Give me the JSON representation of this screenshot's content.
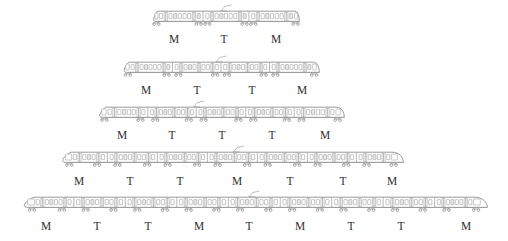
{
  "figure": {
    "kind": "train-formation-diagram",
    "unit_types": {
      "motor": "M",
      "trailer": "T"
    },
    "colors": {
      "outline": "#8e8e8e",
      "window": "#ffffff",
      "door": "#e8e8e8",
      "label": "#2f2f2f",
      "background": "#ffffff"
    }
  },
  "trains": [
    {
      "id": "train-3-car",
      "car_count": 3,
      "formation": "M T M",
      "labels": [
        "M",
        "T",
        "M"
      ],
      "row_top": 8,
      "art_left": 152,
      "art_width": 148,
      "label_y": 33,
      "label_x": [
        174,
        224,
        276
      ],
      "car_breaks": [
        0.345,
        0.655
      ],
      "pantograph_at": 0.5
    },
    {
      "id": "train-4-car",
      "car_count": 4,
      "formation": "M T T M",
      "labels": [
        "M",
        "T",
        "T",
        "M"
      ],
      "row_top": 59,
      "art_left": 122,
      "art_width": 198,
      "label_y": 84,
      "label_x": [
        146,
        197,
        252,
        302
      ],
      "car_breaks": [
        0.255,
        0.5,
        0.745
      ],
      "pantograph_at": 0.5
    },
    {
      "id": "train-5-car",
      "car_count": 5,
      "formation": "M T T T M",
      "labels": [
        "M",
        "T",
        "T",
        "T",
        "M"
      ],
      "row_top": 104,
      "art_left": 97,
      "art_width": 248,
      "label_y": 129,
      "label_x": [
        122,
        172,
        222,
        272,
        325
      ],
      "car_breaks": [
        0.205,
        0.4,
        0.6,
        0.795
      ],
      "pantograph_at": 0.41
    },
    {
      "id": "train-7-car",
      "car_count": 7,
      "formation": "M T T M T T M",
      "labels": [
        "M",
        "T",
        "T",
        "M",
        "T",
        "T",
        "M"
      ],
      "row_top": 149,
      "art_left": 59,
      "art_width": 345,
      "label_y": 175,
      "label_x": [
        79,
        130,
        180,
        237,
        290,
        343,
        392
      ],
      "car_breaks": [
        0.14,
        0.285,
        0.43,
        0.575,
        0.72,
        0.862
      ],
      "pantograph_at": 0.52
    },
    {
      "id": "train-9-car",
      "car_count": 9,
      "formation": "M T T M T M T T M",
      "labels": [
        "M",
        "T",
        "T",
        "M",
        "T",
        "M",
        "T",
        "T",
        "M"
      ],
      "row_top": 194,
      "art_left": 20,
      "art_width": 468,
      "label_y": 220,
      "label_x": [
        46,
        97,
        148,
        199,
        249,
        300,
        351,
        401,
        466
      ],
      "car_breaks": [
        0.115,
        0.225,
        0.335,
        0.445,
        0.556,
        0.666,
        0.776,
        0.886
      ],
      "pantograph_at": 0.5
    }
  ]
}
